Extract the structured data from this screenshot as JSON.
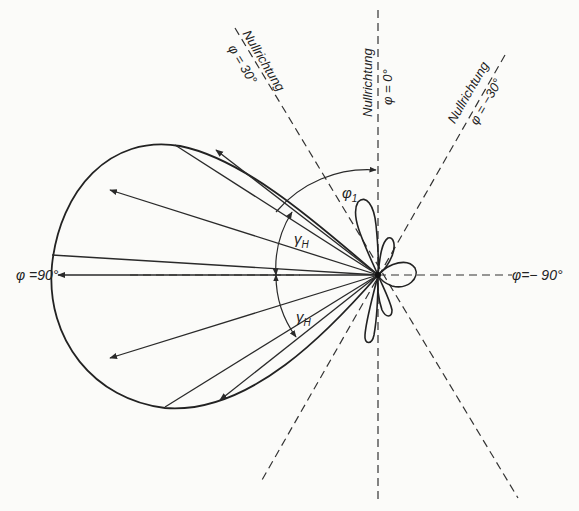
{
  "diagram": {
    "type": "antenna-radiation-pattern",
    "ink_color": "#2a2a2a",
    "background": "#fbfbf9",
    "labels": {
      "null_label": "Nullrichtung",
      "phi_0": "φ = 0°",
      "phi_30": "φ = 30°",
      "phi_m30": "φ = −30°",
      "phi_90": "φ =90°",
      "phi_m90": "φ=− 90°",
      "phi_1": "φ",
      "phi_1_sub": "1",
      "gamma_h": "γ",
      "gamma_h_sub": "H"
    },
    "directions_deg": [
      0,
      30,
      -30,
      90,
      -90
    ],
    "null_directions_deg": [
      30,
      0,
      -30
    ]
  }
}
